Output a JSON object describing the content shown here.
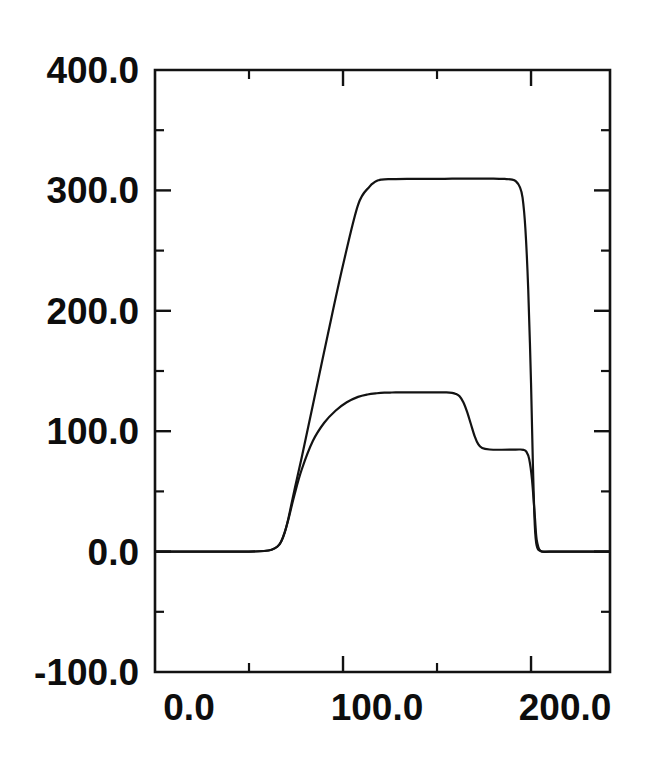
{
  "figure": {
    "background_color": "#ffffff",
    "line_color": "#131313",
    "text_color": "#0d0d0d"
  },
  "axes": {
    "frame": {
      "left": 155,
      "right": 610,
      "top": 70,
      "bottom": 672
    },
    "y_tick_labels": [
      "400.0",
      "300.0",
      "200.0",
      "100.0",
      "0.0",
      "-100.0"
    ],
    "y_tick_values": [
      400,
      300,
      200,
      100,
      0,
      -100
    ],
    "y_minor_values": [
      350,
      250,
      150,
      50,
      -50
    ],
    "x_tick_labels": [
      "0.0",
      "100.0",
      "200.0"
    ],
    "x_tick_values": [
      0,
      100,
      200
    ],
    "x_minor_values": [
      50,
      150
    ]
  },
  "chart_data": {
    "type": "line",
    "title": "",
    "xlabel": "",
    "ylabel": "",
    "xlim": [
      0,
      242
    ],
    "ylim": [
      -100,
      400
    ],
    "grid": false,
    "legend": "none",
    "xticks": [
      0,
      100,
      200
    ],
    "yticks": [
      -100,
      0,
      100,
      200,
      300,
      400
    ],
    "xtick_labels": [
      "0.0",
      "100.0",
      "200.0"
    ],
    "ytick_labels": [
      "-100.0",
      "0.0",
      "100.0",
      "200.0",
      "300.0",
      "400.0"
    ],
    "minor_xticks": [
      50,
      150
    ],
    "minor_yticks": [
      -50,
      50,
      150,
      250,
      350
    ],
    "series": [
      {
        "name": "upper-curve",
        "x": [
          0,
          10,
          20,
          30,
          40,
          50,
          58,
          62,
          65,
          67,
          69,
          71,
          74,
          78,
          84,
          92,
          100,
          108,
          114,
          117,
          119,
          120.5,
          122,
          124,
          128,
          134,
          142,
          150,
          158,
          166,
          174,
          180,
          186,
          190,
          192,
          194,
          195.5,
          197,
          198.5,
          200,
          201,
          202,
          203,
          205,
          210,
          220,
          230,
          242
        ],
        "y": [
          0,
          0,
          0,
          0,
          0,
          0,
          0.5,
          1.5,
          4,
          8,
          16,
          28,
          50,
          78,
          122,
          181,
          238,
          288,
          303,
          307,
          308.5,
          309,
          309.2,
          309.3,
          309.4,
          309.5,
          309.6,
          309.6,
          309.7,
          309.7,
          309.8,
          309.8,
          309.5,
          309,
          307.5,
          303,
          294,
          268,
          218,
          140,
          72,
          22,
          5,
          0.5,
          0,
          0,
          0,
          0
        ]
      },
      {
        "name": "lower-curve",
        "x": [
          0,
          10,
          20,
          30,
          40,
          50,
          58,
          62,
          65,
          67,
          69,
          71,
          74,
          78,
          84,
          90,
          96,
          102,
          108,
          113,
          118,
          122,
          125,
          128,
          132,
          138,
          144,
          150,
          155,
          158,
          160,
          162,
          164,
          166,
          168,
          170,
          172,
          174,
          178,
          184,
          190,
          194,
          196,
          197.5,
          199,
          200.5,
          202,
          203,
          205,
          210,
          220,
          230,
          242
        ],
        "y": [
          0,
          0,
          0,
          0,
          0,
          0,
          0.5,
          1.5,
          4,
          8,
          16,
          27,
          46,
          68,
          92,
          107,
          117,
          124,
          128.5,
          130.5,
          131.5,
          132,
          132.1,
          132.2,
          132.2,
          132.3,
          132.3,
          132.3,
          132.2,
          131.8,
          131,
          129,
          124,
          116,
          106,
          96,
          89,
          86,
          84.8,
          84.6,
          84.7,
          84.8,
          84.5,
          83,
          77,
          60,
          30,
          10,
          0.6,
          0,
          0,
          0,
          0
        ]
      }
    ]
  }
}
